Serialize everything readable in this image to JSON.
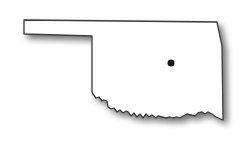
{
  "map": {
    "subject": "Oklahoma state outline",
    "state_name": "Oklahoma",
    "colors": {
      "background": "#ffffff",
      "fill": "#ffffff",
      "outline": "#3a3a3a",
      "shadow": "#8a8a8a",
      "marker": "#1a1a1a"
    },
    "outline_path": "M24,20 L217,22 L222,46 L223,120 L216,117 L212,114 L208,112 L205,114 L202,112 L198,113 L195,116 L191,115 L187,114 L183,116 L180,118 L177,117 L173,118 L170,117 L166,118 L162,117 L158,116 L156,118 L152,115 L149,117 L146,114 L143,118 L140,114 L137,117 L134,113 L131,116 L128,112 L126,111 L123,113 L120,110 L117,112 L114,108 L111,109 L108,107 L107,101 L104,100 L102,101 L99,97 L96,98 L93,94 L92,92 L92,36 L24,34 Z",
    "marker": {
      "cx": 171,
      "cy": 63,
      "r": 3.5,
      "label": "location-marker"
    }
  }
}
